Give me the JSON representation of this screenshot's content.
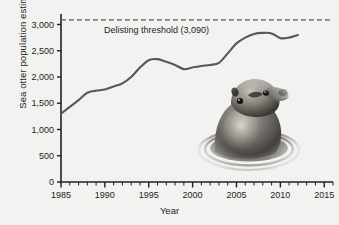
{
  "figure": {
    "background_color": "#f2f2f0",
    "line_color": "#55585a",
    "axis_color": "#231f20",
    "threshold_color": "#5b5e60"
  },
  "axes": {
    "ylabel": "Sea otter population estimate",
    "xlabel": "Year",
    "y_ticks": [
      "0",
      "500",
      "1,000",
      "1,500",
      "2,000",
      "2,500",
      "3,000"
    ],
    "x_ticks": [
      "1985",
      "1990",
      "1995",
      "2000",
      "2005",
      "2010",
      "2015"
    ]
  },
  "annotations": {
    "threshold_label": "Delisting threshold (3,090)"
  },
  "inset": {
    "photo_name": "sea-otter-photo",
    "caption": ""
  },
  "chart_data": {
    "type": "line",
    "title": "",
    "xlabel": "Year",
    "ylabel": "Sea otter population estimate",
    "xlim": [
      1985,
      2016
    ],
    "ylim": [
      0,
      3200
    ],
    "y_ticks": [
      0,
      500,
      1000,
      1500,
      2000,
      2500,
      3000
    ],
    "x_ticks": [
      1985,
      1990,
      1995,
      2000,
      2005,
      2010,
      2015
    ],
    "x_minor_tick_step": 1,
    "grid": false,
    "legend": false,
    "threshold": {
      "label": "Delisting threshold (3,090)",
      "value": 3090,
      "style": "dashed"
    },
    "x": [
      1985,
      1986,
      1987,
      1988,
      1989,
      1990,
      1991,
      1992,
      1993,
      1994,
      1995,
      1996,
      1997,
      1998,
      1999,
      2000,
      2001,
      2002,
      2003,
      2004,
      2005,
      2006,
      2007,
      2008,
      2009,
      2010,
      2011,
      2012
    ],
    "series": [
      {
        "name": "Sea otter population estimate",
        "values": [
          1300,
          1430,
          1560,
          1700,
          1740,
          1760,
          1820,
          1880,
          2000,
          2180,
          2320,
          2340,
          2290,
          2230,
          2150,
          2180,
          2210,
          2230,
          2270,
          2450,
          2640,
          2750,
          2820,
          2840,
          2830,
          2740,
          2750,
          2800
        ]
      }
    ]
  }
}
